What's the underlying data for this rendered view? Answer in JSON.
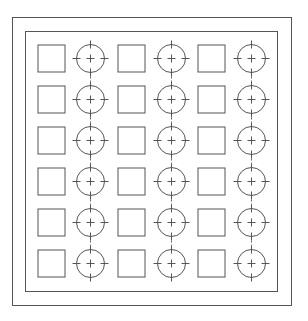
{
  "diagram": {
    "type": "grid-layout",
    "colors": {
      "background": "#ffffff",
      "stroke": "#555555",
      "dash_stroke": "#666666"
    },
    "outer_border": {
      "x": 12.5,
      "y": 17.5,
      "width": 279,
      "height": 288
    },
    "inner_border": {
      "x": 25.5,
      "y": 31.5,
      "width": 252,
      "height": 260
    },
    "rows": 6,
    "row_pitch": 41,
    "first_row_center_y": 58.5,
    "columns": [
      {
        "kind": "square",
        "center_x": 51.5
      },
      {
        "kind": "crosshair-circle",
        "center_x": 90.5
      },
      {
        "kind": "square",
        "center_x": 131.5
      },
      {
        "kind": "crosshair-circle",
        "center_x": 171.5
      },
      {
        "kind": "square",
        "center_x": 211.5
      },
      {
        "kind": "crosshair-circle",
        "center_x": 251.5
      }
    ],
    "square_size": 27,
    "circle_radius": 14,
    "tick_extent": 18,
    "center_cross_half": 4
  }
}
